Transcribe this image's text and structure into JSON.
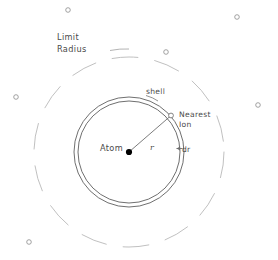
{
  "figure": {
    "name": "atom-shell-limit-radius-diagram",
    "background_color": "#ffffff",
    "width": 278,
    "height": 260
  },
  "geometry": {
    "center": {
      "x": 129,
      "y": 152
    },
    "shell_outer_radius": 55,
    "shell_inner_radius": 51,
    "limit_radius": 95,
    "radius_line_angle_deg": -41,
    "ion_marker_radius": 2.4,
    "atom_dot_radius": 3.1
  },
  "colors": {
    "shell_stroke": "#555555",
    "limit_stroke": "#b9b9b9",
    "ion_stroke": "#8c8c8c",
    "atom_fill": "#000000",
    "text": "#4a4a4a",
    "leader_line": "#6e6e6e"
  },
  "labels": {
    "limit_radius_line1": "Limit",
    "limit_radius_line2": "Radius",
    "shell": "shell",
    "nearest_ion_line1": "Nearest",
    "nearest_ion_line2": "Ion",
    "atom": "Atom",
    "radius_symbol": "r",
    "thickness_symbol": "dr"
  },
  "scattered_ions": [
    {
      "x": 68,
      "y": 10
    },
    {
      "x": 237,
      "y": 17
    },
    {
      "x": 166,
      "y": 52
    },
    {
      "x": 16,
      "y": 97
    },
    {
      "x": 258,
      "y": 105
    },
    {
      "x": 29,
      "y": 242
    }
  ]
}
